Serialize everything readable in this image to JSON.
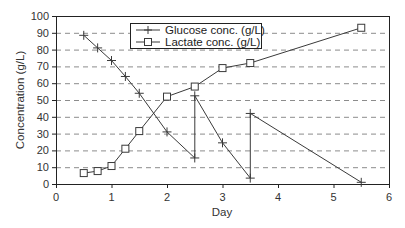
{
  "chart_data": {
    "type": "line",
    "title": "",
    "xlabel": "Day",
    "ylabel": "Concentration (g/L)",
    "xlim": [
      0,
      6
    ],
    "ylim": [
      0,
      100
    ],
    "x_ticks": [
      0,
      1,
      2,
      3,
      4,
      5,
      6
    ],
    "y_ticks": [
      0,
      10,
      20,
      30,
      40,
      50,
      60,
      70,
      80,
      90,
      100
    ],
    "grid": {
      "horizontal": true,
      "style": "dashed"
    },
    "legend": {
      "position": "upper-center-inside",
      "entries": [
        "Glucose conc. (g/L)",
        "Lactate conc. (g/L)"
      ]
    },
    "series": [
      {
        "name": "Glucose conc. (g/L)",
        "marker": "plus",
        "points": [
          [
            0.5,
            88.5
          ],
          [
            0.75,
            81
          ],
          [
            1.0,
            73.5
          ],
          [
            1.25,
            64
          ],
          [
            1.5,
            54
          ],
          [
            2.0,
            31
          ],
          [
            2.5,
            15.5
          ],
          [
            2.5,
            52.5
          ],
          [
            3.0,
            24.5
          ],
          [
            3.5,
            3.5
          ],
          [
            3.5,
            42
          ],
          [
            5.5,
            1
          ]
        ]
      },
      {
        "name": "Lactate conc. (g/L)",
        "marker": "square",
        "points": [
          [
            0.5,
            6.5
          ],
          [
            0.75,
            7.7
          ],
          [
            1.0,
            10.7
          ],
          [
            1.25,
            21
          ],
          [
            1.5,
            31.5
          ],
          [
            2.0,
            52
          ],
          [
            2.5,
            58
          ],
          [
            3.0,
            69
          ],
          [
            3.5,
            72
          ],
          [
            5.5,
            93
          ]
        ]
      }
    ]
  },
  "labels": {
    "xlabel": "Day",
    "ylabel": "Concentration (g/L)",
    "legend_glucose": "Glucose conc. (g/L)",
    "legend_lactate": "Lactate conc. (g/L)"
  },
  "colors": {
    "line": "#3a3a3a",
    "grid": "#8c8c8c",
    "axis": "#222222",
    "marker_fill": "#ffffff"
  }
}
